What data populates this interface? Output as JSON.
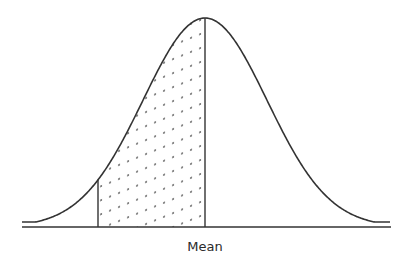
{
  "diagram": {
    "type": "normal-distribution-curve",
    "labels": {
      "mean": "Mean"
    },
    "shaded_region": {
      "from": "left-cutoff",
      "to": "mean",
      "pattern": "dotted-diagonal"
    },
    "colors": {
      "stroke": "#333333",
      "dots": "#444444",
      "background": "#ffffff"
    }
  }
}
